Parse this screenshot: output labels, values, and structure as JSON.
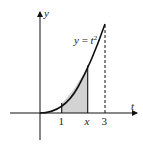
{
  "diagram": {
    "title": "",
    "function_label": "y = t²",
    "function_label_parts": {
      "lhs": "y",
      "eq": " = ",
      "var": "t",
      "exp": "2"
    },
    "axes": {
      "x_label": "t",
      "y_label": "y"
    },
    "ticks": [
      {
        "label": "1",
        "value": 1,
        "italic": false
      },
      {
        "label": "x",
        "value": 2.2,
        "italic": true
      },
      {
        "label": "3",
        "value": 3,
        "italic": false
      }
    ],
    "shaded_region": {
      "from": 1,
      "to": "x",
      "fill": "#d3d3d3"
    },
    "dashed_line_at": 3,
    "colors": {
      "curve": "#111111",
      "axes": "#111111",
      "shade": "#d3d3d3"
    }
  }
}
